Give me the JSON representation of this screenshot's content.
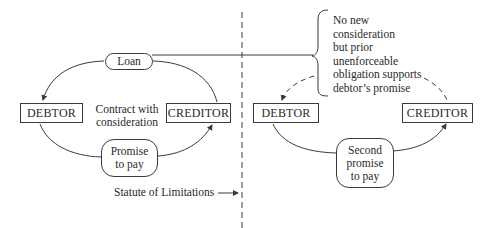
{
  "diagram": {
    "left_panel": {
      "debtor_label": "DEBTOR",
      "creditor_label": "CREDITOR",
      "loan_label": "Loan",
      "center_label_line1": "Contract with",
      "center_label_line2": "consideration",
      "promise_line1": "Promise",
      "promise_line2": "to pay"
    },
    "divider": {
      "label": "Statute of Limitations",
      "style": "dashed"
    },
    "right_panel": {
      "debtor_label": "DEBTOR",
      "creditor_label": "CREDITOR",
      "promise_line1": "Second",
      "promise_line2": "promise",
      "promise_line3": "to pay",
      "note_lines": [
        "No new",
        "consideration",
        "but prior",
        "unenforceable",
        "obligation supports",
        "debtor’s promise"
      ]
    },
    "colors": {
      "stroke": "#3a3a3a",
      "text": "#2a2a2a",
      "background": "#ffffff"
    }
  }
}
